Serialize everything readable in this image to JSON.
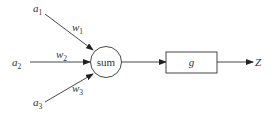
{
  "diagram": {
    "type": "neuron-perceptron",
    "inputs": [
      {
        "name": "a",
        "sub": "1"
      },
      {
        "name": "a",
        "sub": "2"
      },
      {
        "name": "a",
        "sub": "3"
      }
    ],
    "weights": [
      {
        "name": "w",
        "sub": "1"
      },
      {
        "name": "w",
        "sub": "2"
      },
      {
        "name": "w",
        "sub": "3"
      }
    ],
    "sum_node": {
      "label": "sum"
    },
    "activation": {
      "label": "g"
    },
    "output": {
      "label": "Z"
    },
    "colors": {
      "stroke": "#333333",
      "background": "#ffffff"
    }
  }
}
